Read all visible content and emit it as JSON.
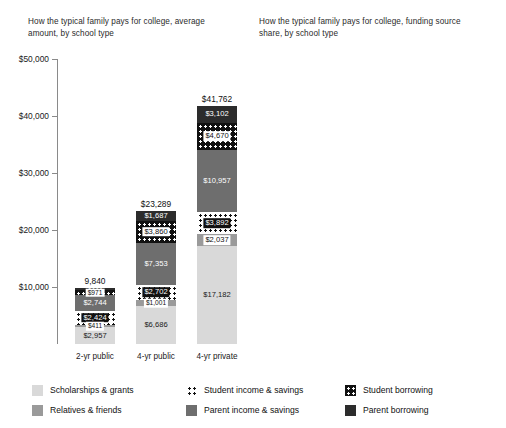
{
  "panels": {
    "left": {
      "title": "How the typical family pays for college, average amount, by school type",
      "axis_ticks": [
        "$10,000",
        "$20,000",
        "$30,000",
        "$40,000",
        "$50,000"
      ]
    },
    "right": {
      "title": "How the typical family pays for college, funding source share, by school type",
      "axis_ticks": [
        "20%",
        "40%",
        "60%",
        "80%",
        "100%"
      ]
    }
  },
  "legend": {
    "columns": [
      [
        {
          "label": "Scholarships & grants",
          "key": "scholarships",
          "color": "#d9d9d9"
        },
        {
          "label": "Relatives & friends",
          "key": "relatives",
          "color": "#9a9a9a"
        }
      ],
      [
        {
          "label": "Student income & savings",
          "key": "student_income",
          "color": "#ffffff"
        },
        {
          "label": "Parent income & savings",
          "key": "parent_income",
          "color": "#6e6e6e"
        }
      ],
      [
        {
          "label": "Student borrowing",
          "key": "student_borrowing",
          "color": "#111111"
        },
        {
          "label": "Parent borrowing",
          "key": "parent_borrowing",
          "color": "#2c2c2c"
        }
      ]
    ]
  },
  "chart_data": [
    {
      "type": "bar",
      "stacked": true,
      "title": "How the typical family pays for college, average amount, by school type",
      "xlabel": "",
      "ylabel": "",
      "ylim": [
        0,
        50000
      ],
      "yticks": [
        10000,
        20000,
        30000,
        40000,
        50000
      ],
      "ytick_labels": [
        "$10,000",
        "$20,000",
        "$30,000",
        "$40,000",
        "$50,000"
      ],
      "grid": false,
      "legend_position": "bottom",
      "categories": [
        "2-yr public",
        "4-yr public",
        "4-yr private"
      ],
      "totals": [
        9840,
        23289,
        41762
      ],
      "total_labels": [
        "9,840",
        "$23,289",
        "$41,762"
      ],
      "series": [
        {
          "name": "Scholarships & grants",
          "values": [
            2957,
            6686,
            17182
          ],
          "labels": [
            "$2,957",
            "$6,686",
            "$17,182"
          ]
        },
        {
          "name": "Relatives & friends",
          "values": [
            411,
            1001,
            2037
          ],
          "labels": [
            "$411",
            "$1,001",
            "$2,037"
          ]
        },
        {
          "name": "Student income & savings",
          "values": [
            2424,
            2702,
            3892
          ],
          "labels": [
            "$2,424",
            "$2,702",
            "$3,892"
          ]
        },
        {
          "name": "Parent income & savings",
          "values": [
            2744,
            7353,
            10957
          ],
          "labels": [
            "$2,744",
            "$7,353",
            "$10,957"
          ]
        },
        {
          "name": "Student borrowing",
          "values": [
            971,
            3860,
            4670
          ],
          "labels": [
            "$971",
            "$3,860",
            "$4,670"
          ]
        },
        {
          "name": "Parent borrowing",
          "values": [
            333,
            1687,
            3102
          ],
          "labels": [
            "$333",
            "$1,687",
            "$3,102"
          ]
        }
      ]
    },
    {
      "type": "bar",
      "stacked": true,
      "title": "How the typical family pays for college, funding source share, by school type",
      "xlabel": "",
      "ylabel": "",
      "ylim": [
        0,
        100
      ],
      "yticks": [
        20,
        40,
        60,
        80,
        100
      ],
      "ytick_labels": [
        "20%",
        "40%",
        "60%",
        "80%",
        "100%"
      ],
      "grid": false,
      "legend_position": "bottom",
      "categories": [
        "2-yr public",
        "4-yr public",
        "4-yr private"
      ],
      "series": [
        {
          "name": "Scholarships & grants",
          "values": [
            30,
            29,
            41
          ],
          "labels": [
            "30%",
            "29%",
            "41%"
          ]
        },
        {
          "name": "Relatives & friends",
          "values": [
            4,
            4,
            5
          ],
          "labels": [
            "4%",
            "4%",
            "5%"
          ]
        },
        {
          "name": "Student income & savings",
          "values": [
            25,
            12,
            9
          ],
          "labels": [
            "25%",
            "12%",
            "9%"
          ]
        },
        {
          "name": "Parent income & savings",
          "values": [
            28,
            32,
            26
          ],
          "labels": [
            "28%",
            "32%",
            "26%"
          ]
        },
        {
          "name": "Student borrowing",
          "values": [
            10,
            17,
            11
          ],
          "labels": [
            "10%",
            "17%",
            "11%"
          ]
        },
        {
          "name": "Parent borrowing",
          "values": [
            3,
            7,
            7
          ],
          "labels": [
            "3%",
            "7%",
            "7%"
          ]
        }
      ]
    }
  ]
}
